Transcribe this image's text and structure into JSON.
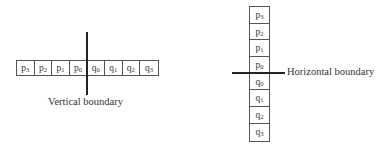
{
  "left_diagram": {
    "cells": [
      {
        "base": "p",
        "sub": "3"
      },
      {
        "base": "p",
        "sub": "2"
      },
      {
        "base": "p",
        "sub": "1"
      },
      {
        "base": "p",
        "sub": "0"
      },
      {
        "base": "q",
        "sub": "0"
      },
      {
        "base": "q",
        "sub": "1"
      },
      {
        "base": "q",
        "sub": "2"
      },
      {
        "base": "q",
        "sub": "3"
      }
    ],
    "boundary_label": "Vertical boundary"
  },
  "right_diagram": {
    "cells": [
      {
        "base": "p",
        "sub": "3"
      },
      {
        "base": "p",
        "sub": "2"
      },
      {
        "base": "p",
        "sub": "1"
      },
      {
        "base": "p",
        "sub": "0"
      },
      {
        "base": "q",
        "sub": "0"
      },
      {
        "base": "q",
        "sub": "1"
      },
      {
        "base": "q",
        "sub": "2"
      },
      {
        "base": "q",
        "sub": "3"
      }
    ],
    "boundary_label": "Horizontal boundary"
  },
  "colors": {
    "line": "#222222",
    "border": "#555555",
    "text": "#333333",
    "background": "#ffffff"
  }
}
